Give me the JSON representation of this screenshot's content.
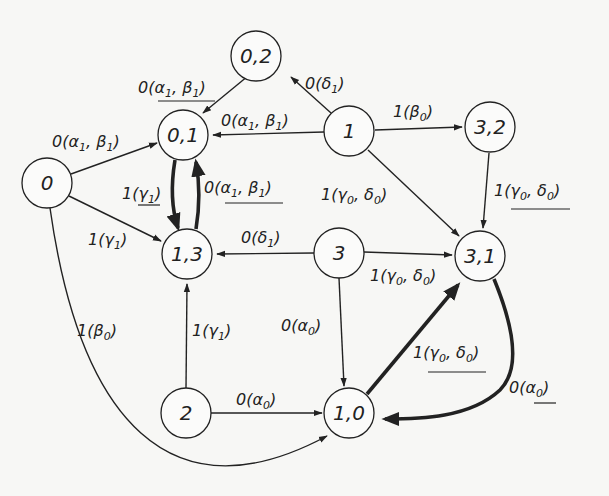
{
  "diagram": {
    "type": "state-transition-graph",
    "nodes": [
      {
        "id": "0",
        "label": "0",
        "x": 47,
        "y": 183
      },
      {
        "id": "02",
        "label": "0,2",
        "x": 256,
        "y": 56
      },
      {
        "id": "01",
        "label": "0,1",
        "x": 183,
        "y": 135
      },
      {
        "id": "1",
        "label": "1",
        "x": 349,
        "y": 131
      },
      {
        "id": "32",
        "label": "3,2",
        "x": 490,
        "y": 127
      },
      {
        "id": "13",
        "label": "1,3",
        "x": 187,
        "y": 254
      },
      {
        "id": "3",
        "label": "3",
        "x": 339,
        "y": 253
      },
      {
        "id": "31",
        "label": "3,1",
        "x": 480,
        "y": 256
      },
      {
        "id": "2",
        "label": "2",
        "x": 186,
        "y": 413
      },
      {
        "id": "10",
        "label": "1,0",
        "x": 349,
        "y": 413
      }
    ],
    "edges": [
      {
        "from": "0",
        "to": "01",
        "label": "0(α1, β1)",
        "underlined": false,
        "bold": false
      },
      {
        "from": "0",
        "to": "13",
        "label": "1(γ1)",
        "underlined": false,
        "bold": false
      },
      {
        "from": "0",
        "to": "10",
        "label": "1(β0)",
        "underlined": false,
        "bold": false
      },
      {
        "from": "02",
        "to": "01",
        "label": "0(α1, β1)",
        "underlined": true,
        "bold": false
      },
      {
        "from": "1",
        "to": "02",
        "label": "0(δ1)",
        "underlined": false,
        "bold": false
      },
      {
        "from": "1",
        "to": "01",
        "label": "0(α1, β1)",
        "underlined": false,
        "bold": false
      },
      {
        "from": "1",
        "to": "32",
        "label": "1(β0)",
        "underlined": false,
        "bold": false
      },
      {
        "from": "1",
        "to": "31",
        "label": "1(γ0, δ0)",
        "underlined": false,
        "bold": false
      },
      {
        "from": "32",
        "to": "31",
        "label": "1(γ0, δ0)",
        "underlined": true,
        "bold": false
      },
      {
        "from": "01",
        "to": "13",
        "label": "1(γ1)",
        "underlined": true,
        "bold": true
      },
      {
        "from": "13",
        "to": "01",
        "label": "0(α1, β1)",
        "underlined": true,
        "bold": true
      },
      {
        "from": "3",
        "to": "13",
        "label": "0(δ1)",
        "underlined": false,
        "bold": false
      },
      {
        "from": "3",
        "to": "31",
        "label": "1(γ0, δ0)",
        "underlined": false,
        "bold": false
      },
      {
        "from": "3",
        "to": "10",
        "label": "0(α0)",
        "underlined": false,
        "bold": false
      },
      {
        "from": "2",
        "to": "13",
        "label": "1(γ1)",
        "underlined": false,
        "bold": false
      },
      {
        "from": "2",
        "to": "10",
        "label": "0(α0)",
        "underlined": false,
        "bold": false
      },
      {
        "from": "10",
        "to": "31",
        "label": "1(γ0, δ0)",
        "underlined": true,
        "bold": true
      },
      {
        "from": "31",
        "to": "10",
        "label": "0(α0)",
        "underlined": true,
        "bold": true
      }
    ]
  },
  "labels": {
    "n0": "0",
    "n02": "0,2",
    "n01": "0,1",
    "n1": "1",
    "n32": "3,2",
    "n13": "1,3",
    "n3": "3",
    "n31": "3,1",
    "n2": "2",
    "n10": "1,0",
    "d0": "0",
    "d1": "1",
    "alpha": "α",
    "beta": "β",
    "gamma": "γ",
    "delta": "δ",
    "open": "(",
    "close": ")",
    "comma": ", "
  }
}
